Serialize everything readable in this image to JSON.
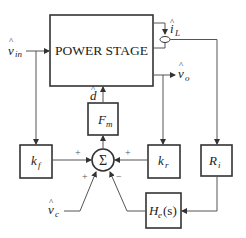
{
  "diagram": {
    "type": "control-block-diagram",
    "colors": {
      "stroke": "#333333",
      "wire": "#555555",
      "background": "#ffffff"
    },
    "blocks": {
      "power_stage": {
        "label": "POWER STAGE"
      },
      "fm": {
        "label": "F",
        "sub": "m"
      },
      "kf": {
        "label": "k",
        "sub": "f"
      },
      "kr": {
        "label": "k",
        "sub": "r"
      },
      "ri": {
        "label": "R",
        "sub": "i"
      },
      "he": {
        "label": "H",
        "sub": "e",
        "suffix": "(s)"
      },
      "sum": {
        "label": "Σ"
      }
    },
    "signals": {
      "vin": {
        "hat": "^",
        "label": "v",
        "sub": "in"
      },
      "il": {
        "hat": "^",
        "label": "i",
        "sub": "L"
      },
      "vo": {
        "hat": "^",
        "label": "v",
        "sub": "o"
      },
      "d": {
        "hat": "^",
        "label": "d"
      },
      "vc": {
        "hat": "^",
        "label": "v",
        "sub": "c"
      }
    },
    "sum_signs": {
      "kf_input": "+",
      "kr_input": "+",
      "vc_input": "+",
      "he_input": "−"
    }
  }
}
